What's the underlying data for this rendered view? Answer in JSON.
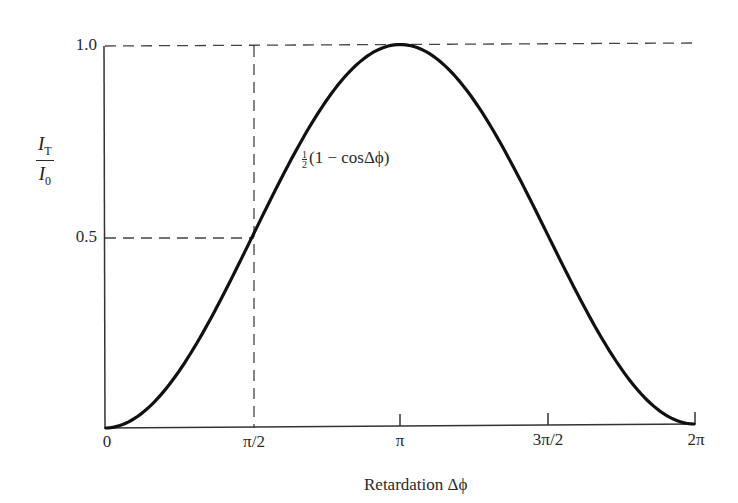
{
  "chart_data": {
    "type": "line",
    "title": "",
    "xlabel": "Retardation Δϕ",
    "ylabel_num": "I",
    "ylabel_num_sub": "T",
    "ylabel_den": "I",
    "ylabel_den_sub": "0",
    "x_tick_labels": [
      "0",
      "π/2",
      "π",
      "3π/2",
      "2π"
    ],
    "x_tick_values": [
      0,
      1.5708,
      3.1416,
      4.7124,
      6.2832
    ],
    "y_tick_labels": [
      "0.5",
      "1.0"
    ],
    "y_tick_values": [
      0.5,
      1.0
    ],
    "xlim": [
      0,
      6.2832
    ],
    "ylim": [
      0,
      1.0
    ],
    "grid": false,
    "legend": null,
    "series": [
      {
        "name": "½(1 − cosΔϕ)",
        "function": "0.5*(1-cos(x))",
        "x": [
          0,
          0.7854,
          1.5708,
          2.3562,
          3.1416,
          3.927,
          4.7124,
          5.4978,
          6.2832
        ],
        "values": [
          0,
          0.146,
          0.5,
          0.854,
          1.0,
          0.854,
          0.5,
          0.146,
          0
        ]
      }
    ],
    "annotations": [
      {
        "text": "½(1 − cosΔϕ)",
        "near_x": 1.9,
        "near_y": 0.72
      },
      {
        "type": "dashed-guide",
        "description": "horizontal at y=0.5 from x=0 to x=π/2, vertical at x=π/2 from y=0 to y=1.0"
      },
      {
        "type": "dashed-guide",
        "description": "horizontal at y=1.0 from x=0 to x=2π"
      }
    ]
  },
  "labels": {
    "annotation_prefix": "(1 − cosΔϕ)",
    "half_num": "1",
    "half_den": "2"
  }
}
